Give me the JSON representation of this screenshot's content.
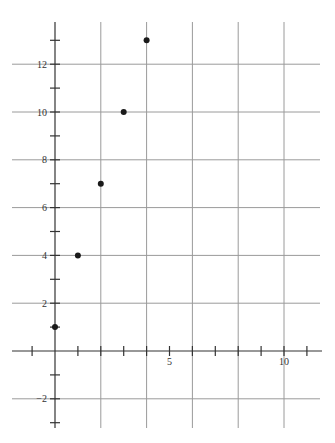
{
  "chart_data": {
    "type": "scatter",
    "title": "",
    "xlabel": "",
    "ylabel": "",
    "x": [
      0,
      1,
      2,
      3,
      4
    ],
    "y": [
      1,
      4,
      7,
      10,
      13
    ],
    "series": [
      {
        "name": "points",
        "x": [
          0,
          1,
          2,
          3,
          4
        ],
        "y": [
          1,
          4,
          7,
          10,
          13
        ]
      }
    ],
    "xlim": [
      -2,
      11.5
    ],
    "ylim": [
      -3.2,
      14.3
    ],
    "x_tick_labels": [
      "5",
      "10"
    ],
    "y_tick_labels": [
      "-2",
      "2",
      "4",
      "6",
      "8",
      "10",
      "12"
    ],
    "grid": true,
    "grid_spacing": 2,
    "legend": null,
    "colors": {
      "point": "#1a1a1a",
      "grid": "#9a9a9a",
      "axis": "#333333"
    }
  }
}
